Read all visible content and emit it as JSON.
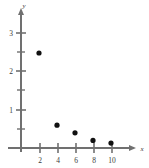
{
  "chart_data": {
    "type": "scatter",
    "title": "",
    "subtitle": "",
    "xlabel": "x",
    "ylabel": "y",
    "xlim": [
      0,
      11.8
    ],
    "ylim": [
      0,
      3.55
    ],
    "grid": false,
    "legend": null,
    "x": [
      2,
      4,
      6,
      8,
      10
    ],
    "values": [
      2.5,
      0.6,
      0.4,
      0.2,
      0.13
    ],
    "points": [
      {
        "x": 2,
        "y": 2.5
      },
      {
        "x": 4,
        "y": 0.6
      },
      {
        "x": 6,
        "y": 0.4
      },
      {
        "x": 8,
        "y": 0.2
      },
      {
        "x": 10,
        "y": 0.13
      }
    ],
    "x_ticks": [
      2,
      4,
      6,
      8,
      10
    ],
    "x_tick_labels": [
      "2",
      "4",
      "6",
      "8",
      "10"
    ],
    "x_minor_ticks": [],
    "y_ticks": [
      1,
      2,
      3
    ],
    "y_tick_labels": [
      "1",
      "2",
      "3"
    ],
    "y_minor_ticks": [
      0.5,
      1.5,
      2.5
    ],
    "marker": "filled-circle",
    "marker_color": "#111111",
    "axis_color": "#707070",
    "label_color": "#3a3a3a",
    "background_color": "#ffffff"
  },
  "figure": {
    "axis_origin_label": "",
    "x_axis_name": "x",
    "y_axis_name": "y"
  }
}
